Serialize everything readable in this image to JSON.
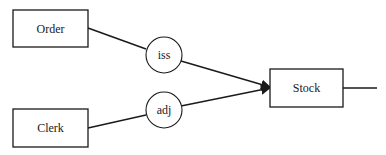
{
  "diagram": {
    "entities": [
      {
        "id": "order",
        "label": "Order"
      },
      {
        "id": "clerk",
        "label": "Clerk"
      },
      {
        "id": "stock",
        "label": "Stock"
      }
    ],
    "relations": [
      {
        "id": "iss",
        "label": "iss"
      },
      {
        "id": "adj",
        "label": "adj"
      }
    ],
    "edges": [
      {
        "from": "order",
        "to": "iss"
      },
      {
        "from": "iss",
        "to": "stock",
        "arrow": true
      },
      {
        "from": "clerk",
        "to": "adj"
      },
      {
        "from": "adj",
        "to": "stock",
        "arrow": true
      },
      {
        "from": "stock",
        "to": "outgoing",
        "arrow": false
      }
    ],
    "colors": {
      "stroke": "#1a1a1a",
      "background": "#ffffff"
    }
  }
}
